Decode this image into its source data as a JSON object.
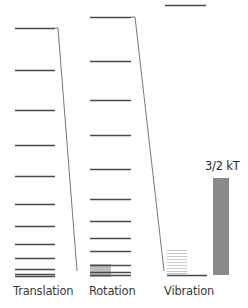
{
  "diagram": {
    "title": "",
    "colors": {
      "level_line": "#4a4a4a",
      "connector": "#555555",
      "vibration_stack": "#b9b9b9",
      "rotation_shade": "#bdbdbd",
      "energy_bar": "#8a8a8a",
      "text": "#3a3a3a"
    },
    "columns": [
      {
        "name": "Translation",
        "label": "Translation",
        "x1": 15,
        "x2": 55,
        "levels_y": [
          28,
          70,
          110,
          145,
          176,
          204,
          226,
          244,
          258,
          269,
          274,
          276
        ]
      },
      {
        "name": "Rotation",
        "label": "Rotation",
        "x1": 90,
        "x2": 131,
        "levels_y": [
          17,
          61,
          100,
          135,
          169,
          199,
          221,
          238,
          251,
          265,
          272,
          275
        ],
        "shade": {
          "x": 90,
          "y": 264,
          "w": 21,
          "h": 13
        }
      },
      {
        "name": "Vibration",
        "label": "Vibration",
        "top_level": {
          "x1": 165,
          "x2": 206,
          "y": 5
        },
        "stack": {
          "x1": 167,
          "x2": 187,
          "levels_y": [
            250,
            253,
            256,
            259,
            262,
            265,
            268,
            271,
            273
          ]
        },
        "baseline": {
          "x1": 167,
          "x2": 207,
          "y": 275
        }
      }
    ],
    "connectors": [
      {
        "from_column": "Translation",
        "to_column": "Rotation",
        "points": [
          [
            55,
            28
          ],
          [
            58,
            28
          ],
          [
            77,
            271
          ]
        ]
      },
      {
        "from_column": "Rotation",
        "to_column": "Vibration",
        "points": [
          [
            131,
            17
          ],
          [
            135,
            17
          ],
          [
            164,
            271
          ]
        ]
      }
    ],
    "energy_bar": {
      "label": "3/2 kT",
      "x": 213,
      "y": 178,
      "w": 16,
      "h": 97
    },
    "labels": {
      "translation": "Translation",
      "rotation": "Rotation",
      "vibration": "Vibration",
      "energy_bar": "3/2 kT"
    }
  }
}
